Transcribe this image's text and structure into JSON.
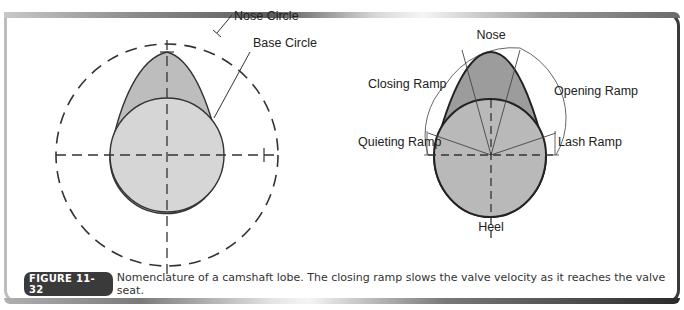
{
  "figure": {
    "badge": "FIGURE 11-32",
    "caption": "Nomenclature of a camshaft lobe. The closing ramp slows the valve velocity as it reaches the valve seat."
  },
  "left_diagram": {
    "labels": {
      "nose_circle": "Nose Circle",
      "base_circle": "Base Circle"
    }
  },
  "right_diagram": {
    "labels": {
      "nose": "Nose",
      "closing_ramp": "Closing Ramp",
      "opening_ramp": "Opening Ramp",
      "quieting_ramp": "Quieting Ramp",
      "lash_ramp": "Lash Ramp",
      "heel": "Heel"
    }
  },
  "colors": {
    "lobe_light": "#d4d4d4",
    "lobe_nose_left": "#bcbcbc",
    "lobe_right_base": "#b8b8b8",
    "lobe_right_nose": "#9a9a9a",
    "outline": "#333333"
  }
}
